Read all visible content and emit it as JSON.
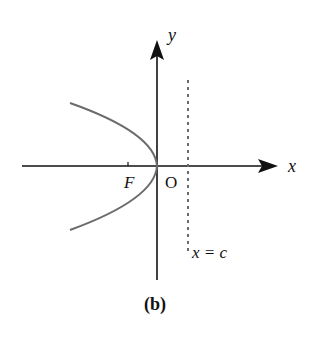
{
  "figure": {
    "caption": "(b)",
    "labels": {
      "y_axis": "y",
      "x_axis": "x",
      "focus": "F",
      "origin": "O",
      "directrix": "x = c"
    },
    "colors": {
      "axes": "#111111",
      "curve": "#6b6b6b",
      "directrix": "#6b6b6b"
    }
  }
}
